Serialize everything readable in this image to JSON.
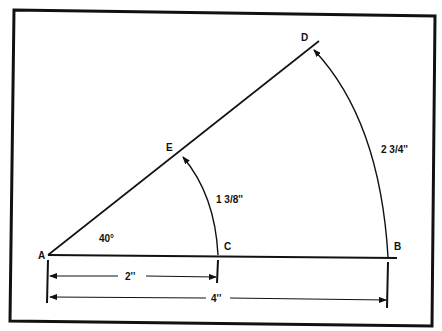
{
  "diagram": {
    "type": "geometry-construction",
    "points": {
      "A": "A",
      "B": "B",
      "C": "C",
      "D": "D",
      "E": "E"
    },
    "angle_label": "40°",
    "arc_small_label": "1 3/8''",
    "arc_large_label": "2 3/4''",
    "dim_short_label": "2''",
    "dim_long_label": "4''"
  }
}
